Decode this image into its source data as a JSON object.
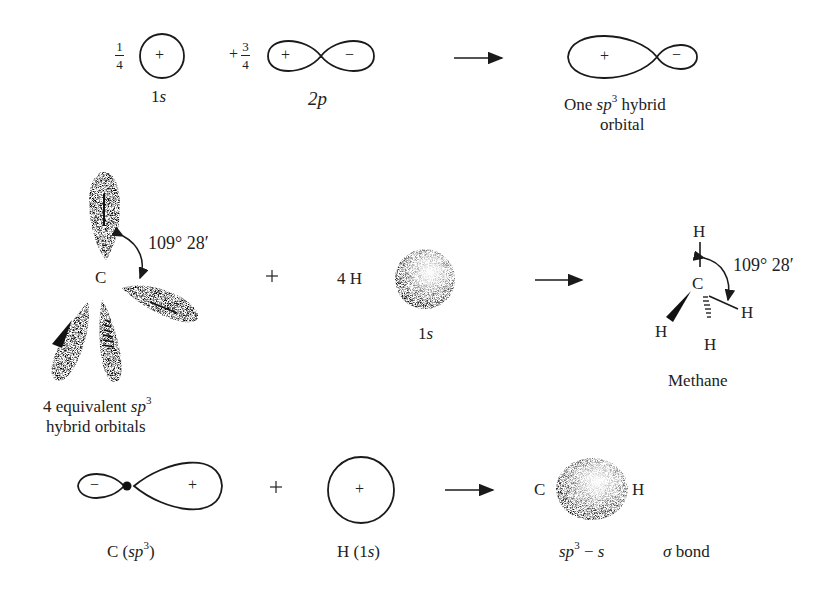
{
  "row1": {
    "coef_1s": {
      "sign": "",
      "num": "1",
      "den": "4"
    },
    "coef_2p": {
      "sign": "+",
      "num": "3",
      "den": "4"
    },
    "orbital_1s": {
      "label": "1",
      "label_italic": "s",
      "lobe_sign": "+"
    },
    "orbital_2p": {
      "label": "2",
      "label_italic": "p",
      "lobe_signs": [
        "+",
        "−"
      ]
    },
    "hybrid": {
      "lobe_signs": [
        "+",
        "−"
      ],
      "caption_pre": "One ",
      "caption_italic": "sp",
      "caption_sup": "3",
      "caption_post": " hybrid",
      "caption_line2": "orbital"
    }
  },
  "row2": {
    "carbon_label": "C",
    "angle": "109° 28′",
    "caption_pre": "4 equivalent ",
    "caption_italic": "sp",
    "caption_sup": "3",
    "caption_line2": "hybrid orbitals",
    "plus": "+",
    "hydrogen": {
      "count_label": "4  H",
      "label": "1",
      "label_italic": "s"
    },
    "methane": {
      "atoms": {
        "c": "C",
        "h_top": "H",
        "h_right": "H",
        "h_left": "H",
        "h_bottom": "H"
      },
      "angle": "109° 28′",
      "caption": "Methane"
    }
  },
  "row3": {
    "c_sp3": {
      "lobe_signs": [
        "−",
        "+"
      ],
      "caption_pre": "C (",
      "caption_italic": "sp",
      "caption_sup": "3",
      "caption_post": ")"
    },
    "plus": "+",
    "h_1s": {
      "lobe_sign": "+",
      "caption_pre": "H (1",
      "caption_italic": "s",
      "caption_post": ")"
    },
    "bond": {
      "left_atom": "C",
      "right_atom": "H",
      "caption_italic": "sp",
      "caption_sup": "3",
      "caption_mid": " − ",
      "caption_italic2": "s",
      "caption_sigma": "σ",
      "caption_post": " bond"
    }
  },
  "colors": {
    "ink": "#1a1a1a",
    "stipple": "#555555",
    "background": "#ffffff"
  }
}
